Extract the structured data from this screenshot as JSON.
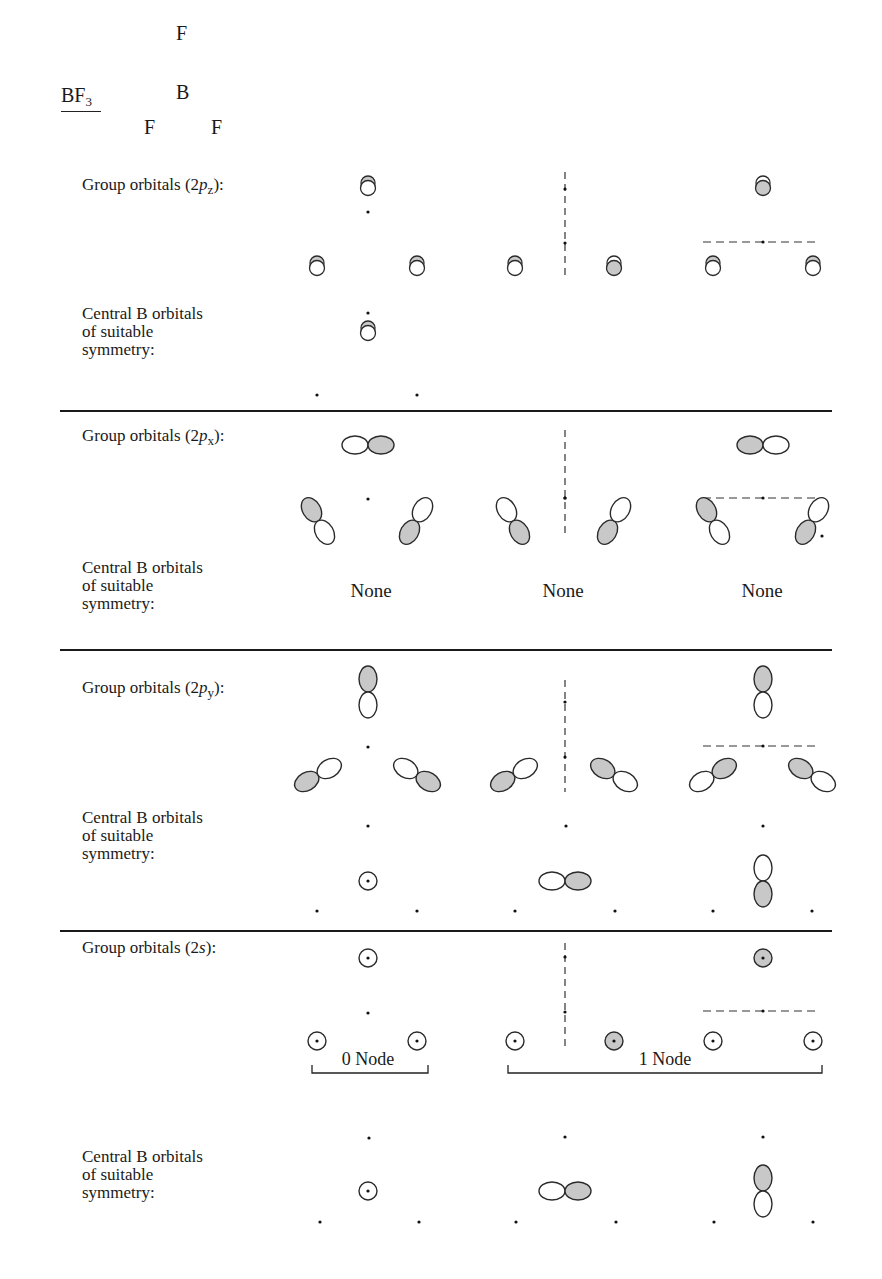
{
  "molecule": {
    "formula": "BF",
    "subscript": "3",
    "atoms": [
      {
        "symbol": "F",
        "x": 183,
        "y": 34
      },
      {
        "symbol": "B",
        "x": 183,
        "y": 93
      },
      {
        "symbol": "F",
        "x": 151,
        "y": 128
      },
      {
        "symbol": "F",
        "x": 218,
        "y": 128
      }
    ]
  },
  "colors": {
    "shade": "#c8c8c8",
    "stroke": "#2a2a2a",
    "rule": "#1a1a1a"
  },
  "sections": [
    {
      "id": "2pz",
      "group_label": {
        "prefix": "Group orbitals (2",
        "italic": "p",
        "sub": "z",
        "suffix": "):",
        "x": 82,
        "y": 185
      },
      "central_label": {
        "lines": [
          "Central B orbitals",
          "of suitable",
          "symmetry:"
        ],
        "x": 82,
        "y": 314
      },
      "central_none": null
    },
    {
      "id": "2px",
      "group_label": {
        "prefix": "Group orbitals (2",
        "italic": "p",
        "sub": "x",
        "suffix": "):",
        "x": 82,
        "y": 436
      },
      "central_label": {
        "lines": [
          "Central B orbitals",
          "of suitable",
          "symmetry:"
        ],
        "x": 82,
        "y": 568
      },
      "central_none": [
        {
          "text": "None",
          "x": 371,
          "y": 591
        },
        {
          "text": "None",
          "x": 563,
          "y": 591
        },
        {
          "text": "None",
          "x": 762,
          "y": 591
        }
      ]
    },
    {
      "id": "2py",
      "group_label": {
        "prefix": "Group orbitals (2",
        "italic": "p",
        "sub": "y",
        "suffix": "):",
        "x": 82,
        "y": 688
      },
      "central_label": {
        "lines": [
          "Central B orbitals",
          "of suitable",
          "symmetry:"
        ],
        "x": 82,
        "y": 818
      },
      "central_none": null
    },
    {
      "id": "2s",
      "group_label": {
        "prefix": "Group orbitals (2",
        "italic": "s",
        "sub": "",
        "suffix": "):",
        "x": 82,
        "y": 948
      },
      "central_label": {
        "lines": [
          "Central B orbitals",
          "of suitable",
          "symmetry:"
        ],
        "x": 82,
        "y": 1157
      },
      "central_none": null
    }
  ],
  "node_labels": [
    {
      "text": "0 Node",
      "x": 368,
      "y": 1060
    },
    {
      "text": "1 Node",
      "x": 665,
      "y": 1060
    }
  ],
  "rules": [
    {
      "x1": 60,
      "x2": 832,
      "y": 411
    },
    {
      "x1": 60,
      "x2": 832,
      "y": 650
    },
    {
      "x1": 60,
      "x2": 832,
      "y": 931
    }
  ],
  "brackets": [
    {
      "x1": 312,
      "x2": 428,
      "y": 1073,
      "h": 8
    },
    {
      "x1": 508,
      "x2": 822,
      "y": 1073,
      "h": 8
    }
  ],
  "dots": [
    [
      368,
      212
    ],
    [
      368,
      313
    ],
    [
      317,
      395
    ],
    [
      417,
      395
    ],
    [
      368,
      499
    ],
    [
      368,
      747
    ],
    [
      368,
      826
    ],
    [
      566,
      826
    ],
    [
      763,
      826
    ],
    [
      317,
      911
    ],
    [
      417,
      911
    ],
    [
      515,
      911
    ],
    [
      615,
      911
    ],
    [
      713,
      911
    ],
    [
      812,
      911
    ],
    [
      368,
      1013
    ],
    [
      369,
      1138
    ],
    [
      565,
      1137
    ],
    [
      763,
      1137
    ],
    [
      320,
      1222
    ],
    [
      419,
      1222
    ],
    [
      516,
      1222
    ],
    [
      616,
      1222
    ],
    [
      714,
      1222
    ],
    [
      813,
      1222
    ],
    [
      822,
      536
    ]
  ],
  "vnodes": [
    {
      "x": 565,
      "y1": 172,
      "y2": 278,
      "dots": [
        189,
        243
      ]
    },
    {
      "x": 565,
      "y1": 430,
      "y2": 535,
      "dots": [
        498,
        498
      ]
    },
    {
      "x": 565,
      "y1": 680,
      "y2": 792,
      "dots": [
        702,
        757
      ]
    },
    {
      "x": 565,
      "y1": 943,
      "y2": 1047,
      "dots": [
        957,
        1012
      ]
    }
  ],
  "hnodes": [
    {
      "x1": 703,
      "x2": 820,
      "y": 242,
      "dot": 763
    },
    {
      "x1": 703,
      "x2": 820,
      "y": 498,
      "dot": 763
    },
    {
      "x1": 703,
      "x2": 820,
      "y": 746,
      "dot": 763
    },
    {
      "x1": 703,
      "x2": 820,
      "y": 1011,
      "dot": 763
    }
  ],
  "pz_orbitals": [
    {
      "x": 368,
      "y": 187,
      "phase": "top"
    },
    {
      "x": 317,
      "y": 267,
      "phase": "top"
    },
    {
      "x": 417,
      "y": 267,
      "phase": "top"
    },
    {
      "x": 515,
      "y": 267,
      "phase": "top"
    },
    {
      "x": 614,
      "y": 267,
      "phase": "bottom"
    },
    {
      "x": 713,
      "y": 267,
      "phase": "top"
    },
    {
      "x": 813,
      "y": 267,
      "phase": "top"
    },
    {
      "x": 763,
      "y": 187,
      "phase": "bottom"
    },
    {
      "x": 368,
      "y": 332,
      "phase": "top"
    }
  ],
  "p_lobes": [
    {
      "cx": 368,
      "cy": 445,
      "angle": 0,
      "shaded": "pos"
    },
    {
      "cx": 763,
      "cy": 445,
      "angle": 0,
      "shaded": "neg"
    },
    {
      "cx": 318,
      "cy": 521,
      "angle": 60,
      "shaded": "neg"
    },
    {
      "cx": 416,
      "cy": 521,
      "angle": -60,
      "shaded": "neg"
    },
    {
      "cx": 513,
      "cy": 521,
      "angle": 60,
      "shaded": "pos"
    },
    {
      "cx": 614,
      "cy": 521,
      "angle": -60,
      "shaded": "neg"
    },
    {
      "cx": 713,
      "cy": 521,
      "angle": 60,
      "shaded": "neg"
    },
    {
      "cx": 812,
      "cy": 521,
      "angle": -60,
      "shaded": "neg"
    },
    {
      "cx": 368,
      "cy": 692,
      "angle": 90,
      "shaded": "neg"
    },
    {
      "cx": 763,
      "cy": 692,
      "angle": 90,
      "shaded": "neg"
    },
    {
      "cx": 318,
      "cy": 775,
      "angle": -30,
      "shaded": "neg"
    },
    {
      "cx": 417,
      "cy": 775,
      "angle": 30,
      "shaded": "pos"
    },
    {
      "cx": 514,
      "cy": 775,
      "angle": -30,
      "shaded": "neg"
    },
    {
      "cx": 614,
      "cy": 775,
      "angle": 30,
      "shaded": "neg"
    },
    {
      "cx": 713,
      "cy": 775,
      "angle": -30,
      "shaded": "pos"
    },
    {
      "cx": 812,
      "cy": 775,
      "angle": 30,
      "shaded": "neg"
    },
    {
      "cx": 565,
      "cy": 881,
      "angle": 0,
      "shaded": "pos"
    },
    {
      "cx": 763,
      "cy": 881,
      "angle": 90,
      "shaded": "pos"
    },
    {
      "cx": 565,
      "cy": 1191,
      "angle": 0,
      "shaded": "pos"
    },
    {
      "cx": 763,
      "cy": 1191,
      "angle": 90,
      "shaded": "neg"
    }
  ],
  "s_orbitals": [
    {
      "x": 368,
      "y": 881,
      "shaded": false
    },
    {
      "x": 368,
      "y": 958,
      "shaded": false
    },
    {
      "x": 763,
      "y": 958,
      "shaded": true
    },
    {
      "x": 317,
      "y": 1041,
      "shaded": false
    },
    {
      "x": 417,
      "y": 1041,
      "shaded": false
    },
    {
      "x": 515,
      "y": 1041,
      "shaded": false
    },
    {
      "x": 614,
      "y": 1041,
      "shaded": true
    },
    {
      "x": 713,
      "y": 1041,
      "shaded": false
    },
    {
      "x": 813,
      "y": 1041,
      "shaded": false
    },
    {
      "x": 368,
      "y": 1191,
      "shaded": false
    }
  ]
}
